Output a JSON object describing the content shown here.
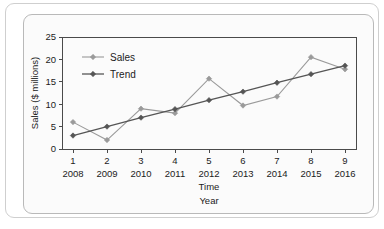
{
  "chart_data": {
    "type": "line",
    "title": "",
    "xlabel": "Time\nYear",
    "xlabel_line1": "Time",
    "xlabel_line2": "Year",
    "ylabel": "Sales ($ millions)",
    "ylim": [
      0,
      25
    ],
    "yticks": [
      0,
      5,
      10,
      15,
      20,
      25
    ],
    "ytick_labels": [
      "0",
      "5",
      "10",
      "15",
      "20",
      "25"
    ],
    "x_index": [
      1,
      2,
      3,
      4,
      5,
      6,
      7,
      8,
      9
    ],
    "x_index_labels": [
      "1",
      "2",
      "3",
      "4",
      "5",
      "6",
      "7",
      "8",
      "9"
    ],
    "categories": [
      "2008",
      "2009",
      "2010",
      "2011",
      "2012",
      "2013",
      "2014",
      "2015",
      "2016"
    ],
    "grid": false,
    "legend_position": "upper-left",
    "series": [
      {
        "name": "Sales",
        "color": "#9a9a9a",
        "values": [
          6.0,
          2.0,
          9.0,
          8.0,
          15.7,
          9.7,
          11.7,
          20.5,
          17.8
        ]
      },
      {
        "name": "Trend",
        "color": "#555555",
        "values": [
          3.0,
          5.0,
          7.0,
          8.9,
          10.9,
          12.8,
          14.8,
          16.7,
          18.6
        ]
      }
    ]
  },
  "legend": {
    "entries": [
      {
        "label": "Sales"
      },
      {
        "label": "Trend"
      }
    ]
  },
  "colors": {
    "sales": "#9a9a9a",
    "trend": "#555555",
    "axis": "#4a4a4a",
    "text": "#1b1b1b",
    "card_bg": "#fbfbfb"
  }
}
